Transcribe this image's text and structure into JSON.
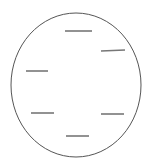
{
  "figure": {
    "title": "circle-with-dashes-diagram",
    "type": "line-drawing",
    "canvas": {
      "width": 153,
      "height": 167,
      "background_color": "#ffffff"
    },
    "circle": {
      "name": "outer-circle",
      "center_x": 76,
      "center_y": 85,
      "radius_x": 65,
      "radius_y": 72,
      "stroke_color": "#555555",
      "stroke_width": 1,
      "fill": "none"
    },
    "dashes": {
      "stroke_color": "#777777",
      "stroke_width": 1.6,
      "count": 6,
      "items": [
        {
          "name": "dash-top",
          "x1": 65,
          "y1": 31,
          "x2": 92,
          "y2": 31,
          "length": 27
        },
        {
          "name": "dash-upper-right",
          "x1": 101,
          "y1": 51,
          "x2": 125,
          "y2": 50,
          "length": 24
        },
        {
          "name": "dash-left",
          "x1": 26,
          "y1": 71,
          "x2": 48,
          "y2": 71,
          "length": 22
        },
        {
          "name": "dash-lower-left",
          "x1": 31,
          "y1": 113,
          "x2": 54,
          "y2": 113,
          "length": 23
        },
        {
          "name": "dash-lower-right",
          "x1": 101,
          "y1": 114,
          "x2": 124,
          "y2": 114,
          "length": 23
        },
        {
          "name": "dash-bottom",
          "x1": 66,
          "y1": 136,
          "x2": 89,
          "y2": 136,
          "length": 23
        }
      ]
    }
  }
}
